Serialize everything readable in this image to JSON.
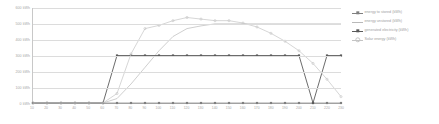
{
  "chart_data": {
    "type": "line",
    "title": "",
    "subtitle": "",
    "xlabel": "",
    "ylabel": "",
    "grid": true,
    "legend_position": "right",
    "ylim": [
      0,
      600
    ],
    "ytick_labels": [
      "600 kWh",
      "500 kWh",
      "400 kWh",
      "300 kWh",
      "200 kWh",
      "100 kWh",
      "0 kWh"
    ],
    "ytick_values": [
      600,
      500,
      400,
      300,
      200,
      100,
      0
    ],
    "x": [
      10,
      20,
      30,
      40,
      50,
      60,
      70,
      80,
      90,
      100,
      110,
      120,
      130,
      140,
      150,
      160,
      170,
      180,
      190,
      200,
      210,
      220,
      230
    ],
    "xtick_labels": [
      "10",
      "20",
      "30",
      "40",
      "50",
      "60",
      "70",
      "80",
      "90",
      "100",
      "110",
      "120",
      "130",
      "140",
      "150",
      "160",
      "170",
      "180",
      "190",
      "200",
      "210",
      "220",
      "230"
    ],
    "series": [
      {
        "name": "energy to stored (kWh)",
        "color": "#7f7f7f",
        "marker": "square",
        "values": [
          0,
          0,
          0,
          0,
          0,
          0,
          0,
          0,
          0,
          0,
          0,
          0,
          0,
          0,
          0,
          0,
          0,
          0,
          0,
          0,
          0,
          0,
          0
        ]
      },
      {
        "name": "energy unstored (kWh)",
        "color": "#b9b9b9",
        "marker": "none",
        "values": [
          0,
          0,
          0,
          0,
          0,
          0,
          28,
          120,
          225,
          330,
          420,
          470,
          487,
          500,
          500,
          500,
          500,
          500,
          500,
          500,
          500,
          500,
          500
        ]
      },
      {
        "name": "generated electricity (kWh)",
        "color": "#5a5a5a",
        "marker": "square",
        "values": [
          0,
          0,
          0,
          0,
          0,
          0,
          300,
          300,
          300,
          300,
          300,
          300,
          300,
          300,
          300,
          300,
          300,
          300,
          300,
          300,
          0,
          300,
          300
        ]
      },
      {
        "name": "Solar energy (kWh)",
        "color": "#c4c4c4",
        "marker": "round",
        "values": [
          0,
          0,
          0,
          0,
          0,
          0,
          60,
          310,
          470,
          490,
          520,
          540,
          530,
          520,
          520,
          505,
          480,
          440,
          390,
          330,
          250,
          150,
          40
        ]
      }
    ],
    "annotations": []
  },
  "legend": {
    "items": [
      {
        "label": "energy to stored (kWh)"
      },
      {
        "label": "energy unstored (kWh)"
      },
      {
        "label": "generated electricity (kWh)"
      },
      {
        "label": "Solar energy (kWh)"
      }
    ]
  }
}
